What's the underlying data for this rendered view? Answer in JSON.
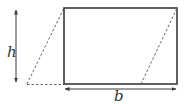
{
  "diagram": {
    "labels": {
      "height": "h",
      "base": "b"
    },
    "colors": {
      "stroke": "#3a3a3a",
      "dashed": "#666666",
      "background": "#ffffff"
    },
    "shapes": {
      "rectangle": {
        "x": 64,
        "y": 8,
        "width": 113,
        "height": 76
      },
      "left_triangle_dashed": {
        "points": [
          [
            27,
            84
          ],
          [
            64,
            8
          ],
          [
            64,
            84
          ]
        ]
      },
      "right_dashed_line": {
        "from": [
          141,
          84
        ],
        "to": [
          177,
          8
        ]
      },
      "height_arrow": {
        "x": 16,
        "y1": 9,
        "y2": 83
      },
      "base_arrow": {
        "y": 89,
        "x1": 64,
        "x2": 177
      }
    }
  }
}
